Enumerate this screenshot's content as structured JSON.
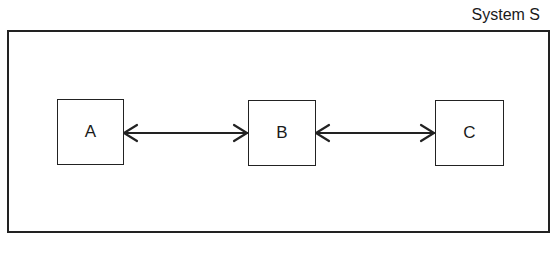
{
  "diagram": {
    "title": "System S",
    "nodes": [
      {
        "id": "A",
        "label": "A"
      },
      {
        "id": "B",
        "label": "B"
      },
      {
        "id": "C",
        "label": "C"
      }
    ],
    "edges": [
      {
        "from": "A",
        "to": "B",
        "type": "bidirectional"
      },
      {
        "from": "B",
        "to": "C",
        "type": "bidirectional"
      }
    ]
  }
}
